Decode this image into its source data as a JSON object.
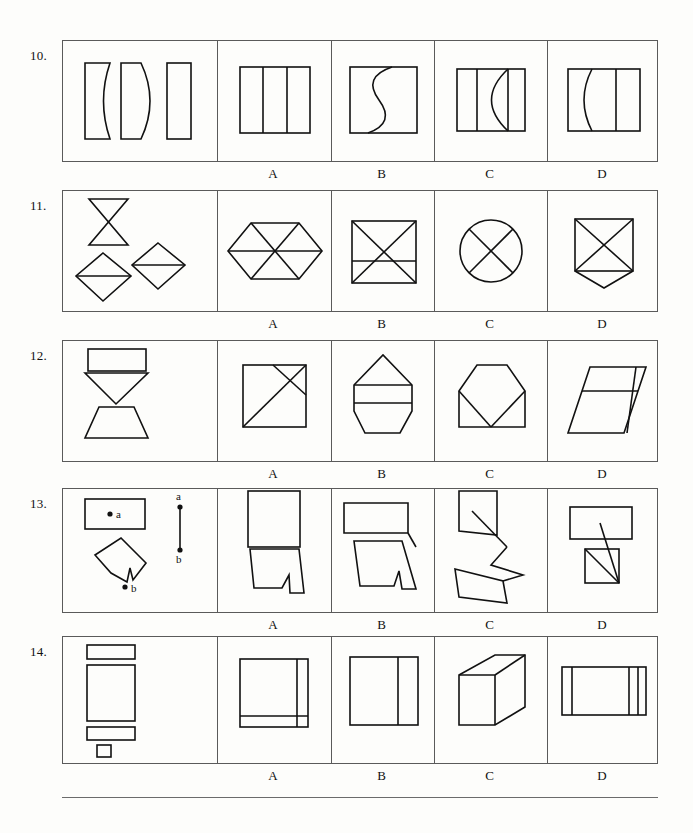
{
  "page": {
    "background_color": "#fdfdfb",
    "ink_color": "#111111",
    "rule_color": "#6b6b6b",
    "footer_rule": true
  },
  "option_labels": [
    "A",
    "B",
    "C",
    "D"
  ],
  "rows": [
    {
      "number": "10.",
      "problem_description": "Three vertical rectangles: left one with concave right edge, middle one with convex right edge (lens/leaf shape), and a plain narrow rectangle.",
      "options": [
        {
          "label": "A",
          "description": "Rectangle divided into three vertical strips by two straight vertical lines."
        },
        {
          "label": "B",
          "description": "Square with an S-shaped curve running from top edge to bottom edge."
        },
        {
          "label": "C",
          "description": "Rectangle with a vertical line near the left and a bowed arc near the right forming a crescent."
        },
        {
          "label": "D",
          "description": "Rectangle with a leftward-bowing arc on the left and a straight vertical line on the right."
        }
      ]
    },
    {
      "number": "11.",
      "problem_description": "An hourglass (two triangles apex to apex) at top-left, a small diamond with a horizontal midline at bottom-left, and another diamond with a horizontal midline at middle-right.",
      "options": [
        {
          "label": "A",
          "description": "Elongated hexagon divided into six triangles by a horizontal midline and two diagonals."
        },
        {
          "label": "B",
          "description": "Square with both diagonals drawn plus a horizontal line across the lower third."
        },
        {
          "label": "C",
          "description": "Circle with an X drawn through it."
        },
        {
          "label": "D",
          "description": "Square with both diagonals and a triangular point extending below the bottom edge."
        }
      ]
    },
    {
      "number": "12.",
      "problem_description": "A wide flat rectangle on top, a downward-pointing triangle below it, and a trapezoid (wider at bottom) at the bottom.",
      "options": [
        {
          "label": "A",
          "description": "Square crossed by two parallel diagonal lines running lower-left to upper-right."
        },
        {
          "label": "B",
          "description": "Pentagon-like shape with a pointed top and two horizontal lines forming a band across the middle."
        },
        {
          "label": "C",
          "description": "Hexagon-like shape sitting on a flat base with a V notch from the sides meeting at the bottom center."
        },
        {
          "label": "D",
          "description": "Parallelogram divided by a horizontal line and a near-vertical line near the right edge."
        }
      ]
    },
    {
      "number": "13.",
      "problem_description": "A horizontal rectangle containing a dot labelled a; below it a tilted quadrilateral with a notch and a dot labelled b at its lower tip. To the right, a vertical segment with a dot labelled a at the top and a dot labelled b at the bottom.",
      "options": [
        {
          "label": "A",
          "description": "A tall rectangle stacked directly above a notched trapezoid, touching edge to edge."
        },
        {
          "label": "B",
          "description": "A wide rectangle above a notched quadrilateral, joined at the right side by a slanted line."
        },
        {
          "label": "C",
          "description": "A tall narrow shape above a notched shape, connected by a zig-zag line."
        },
        {
          "label": "D",
          "description": "A wide rectangle above a small square with a diagonal, joined by a long slanting line."
        }
      ]
    },
    {
      "number": "14.",
      "problem_description": "Stacked flat shapes: a thin horizontal rectangle, a large upright rectangle, another thin horizontal rectangle, and a small square at the bottom.",
      "options": [
        {
          "label": "A",
          "description": "Square with a narrow vertical strip on the right and a narrow horizontal strip along the bottom."
        },
        {
          "label": "B",
          "description": "Square with one vertical line dividing off a narrow panel on the right."
        },
        {
          "label": "C",
          "description": "Cube drawn in isometric perspective showing top and right faces."
        },
        {
          "label": "D",
          "description": "Wide rectangle with a narrow vertical strip at the left and two narrow vertical strips at the right."
        }
      ]
    }
  ]
}
